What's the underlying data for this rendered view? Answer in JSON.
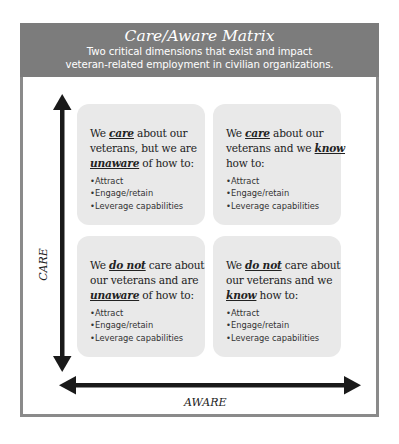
{
  "header": {
    "title": "Care/Aware Matrix",
    "subtitle_line1": "Two critical dimensions that exist and impact",
    "subtitle_line2": "veteran-related employment in civilian organizations."
  },
  "axes": {
    "y_label": "CARE",
    "x_label": "AWARE"
  },
  "quadrants": {
    "top_left": {
      "pre": "We ",
      "em1": "care",
      "mid": " about our veterans, but we are ",
      "em2": "unaware",
      "post": " of how to:",
      "items": [
        "Attract",
        "Engage/retain",
        "Leverage capabilities"
      ]
    },
    "top_right": {
      "pre": "We ",
      "em1": "care",
      "mid": " about our veterans and we ",
      "em2": "know",
      "post": " how to:",
      "items": [
        "Attract",
        "Engage/retain",
        "Leverage capabilities"
      ]
    },
    "bottom_left": {
      "pre": "We ",
      "em1": "do not",
      "mid": " care about our veterans and are ",
      "em2": "unaware",
      "post": " of how to:",
      "items": [
        "Attract",
        "Engage/retain",
        "Leverage capabilities"
      ]
    },
    "bottom_right": {
      "pre": "We ",
      "em1": "do not",
      "mid": " care about our veterans and we ",
      "em2": "know",
      "post": " how to:",
      "items": [
        "Attract",
        "Engage/retain",
        "Leverage capabilities"
      ]
    }
  },
  "colors": {
    "header_bg": "#7c7c7c",
    "frame_border": "#8a8a8a",
    "box_bg": "#e9e9e9",
    "arrow": "#1a1a1a"
  }
}
